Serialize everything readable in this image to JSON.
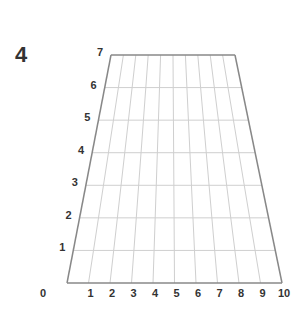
{
  "problem_number": "4",
  "grid": {
    "x_labels": [
      "0",
      "1",
      "2",
      "3",
      "4",
      "5",
      "6",
      "7",
      "8",
      "9",
      "10"
    ],
    "y_labels": [
      "1",
      "2",
      "3",
      "4",
      "5",
      "6",
      "7"
    ],
    "top_left": [
      111,
      55
    ],
    "top_right": [
      235,
      55
    ],
    "bottom_left": [
      67,
      283
    ],
    "bottom_right": [
      282,
      283
    ],
    "border_color": "#888888",
    "grid_color": "#cfcfcf"
  }
}
